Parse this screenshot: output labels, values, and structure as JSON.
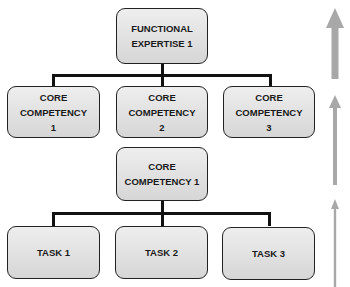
{
  "diagram": {
    "top_node": {
      "label_line1": "FUNCTIONAL",
      "label_line2": "EXPERTISE 1"
    },
    "level2_nodes": [
      {
        "label_line1": "CORE COMPETENCY",
        "label_line2": "1"
      },
      {
        "label_line1": "CORE COMPETENCY",
        "label_line2": "2"
      },
      {
        "label_line1": "CORE COMPETENCY",
        "label_line2": "3"
      }
    ],
    "mid_node": {
      "label_line1": "CORE",
      "label_line2": "COMPETENCY 1"
    },
    "task_nodes": [
      {
        "label": "TASK 1"
      },
      {
        "label": "TASK 2"
      },
      {
        "label": "TASK 3"
      }
    ],
    "arrows": [
      {
        "direction": "up",
        "weight": "thick"
      },
      {
        "direction": "up",
        "weight": "medium"
      },
      {
        "direction": "up",
        "weight": "thin"
      }
    ],
    "colors": {
      "box_fill": "#e0e0e0",
      "box_border": "#222222",
      "connector": "#111111",
      "arrow": "#a8a8a8"
    }
  }
}
